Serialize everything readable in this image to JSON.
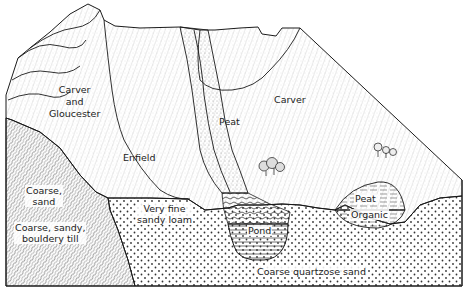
{
  "diagram": {
    "type": "block-diagram-soil-landscape",
    "colors": {
      "line": "#1a1a1a",
      "background": "#ffffff",
      "till_hatch": "#555555",
      "sand_dot": "#333333",
      "shading": "#888888"
    },
    "labels": {
      "carver_and_gloucester": [
        "Carver",
        "and",
        "Gloucester"
      ],
      "enfield": "Enfield",
      "peat_channel": "Peat",
      "carver": "Carver",
      "coarse_sand": [
        "Coarse,",
        "sand"
      ],
      "coarse_sandy_bouldery_till": [
        "Coarse, sandy,",
        "bouldery till"
      ],
      "very_fine_sandy_loam": [
        "Very fine",
        "sandy loam"
      ],
      "pond": "Pond",
      "peat_bog": "Peat",
      "organic": "Organic",
      "coarse_quartzose_sand": "Coarse quartzose sand"
    }
  }
}
